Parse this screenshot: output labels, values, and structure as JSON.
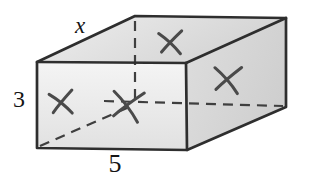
{
  "figure": {
    "width": 312,
    "height": 188,
    "background": "#ffffff",
    "labels": {
      "top_edge": "x",
      "left_edge": "3",
      "bottom_edge": "5"
    },
    "colors": {
      "edge": "#2e2e2e",
      "dash": "#3f3f3f",
      "xmark": "#4a4a4a",
      "front_face_from": "#f4f4f4",
      "front_face_to": "#e1e1e1",
      "top_face_from": "#eeeeee",
      "top_face_to": "#d3d3d3",
      "right_face_from": "#dedede",
      "right_face_to": "#cfcfcf"
    },
    "geometry": {
      "vertices": {
        "A": [
          37,
          62
        ],
        "B": [
          186,
          63
        ],
        "C": [
          187,
          150
        ],
        "D": [
          37,
          148
        ],
        "E": [
          135,
          16
        ],
        "F": [
          286,
          18
        ],
        "G": [
          286,
          107
        ],
        "H": [
          135,
          103
        ]
      },
      "faces": [
        {
          "id": "top-face",
          "points": [
            "A",
            "E",
            "F",
            "B"
          ],
          "gradient": "grad-top"
        },
        {
          "id": "right-face",
          "points": [
            "B",
            "F",
            "G",
            "C"
          ],
          "gradient": "grad-right"
        },
        {
          "id": "front-face",
          "points": [
            "A",
            "B",
            "C",
            "D"
          ],
          "gradient": "grad-front"
        }
      ],
      "outer_outline": [
        "D",
        "A",
        "E",
        "F",
        "G",
        "C"
      ],
      "inner_edges": [
        {
          "id": "front-top-edge",
          "from": "A",
          "to": "B"
        },
        {
          "id": "front-right-edge",
          "from": "B",
          "to": "C"
        },
        {
          "id": "top-right-edge",
          "from": "B",
          "to": "F"
        }
      ],
      "dashed_lines": [
        {
          "id": "hidden-vertical-edge",
          "x1": 135,
          "y1": 21,
          "x2": 135,
          "y2": 100
        },
        {
          "id": "hidden-horizontal-edge",
          "x1": 104,
          "y1": 101,
          "x2": 283,
          "y2": 106
        },
        {
          "id": "hidden-diagonal-edge",
          "x1": 40,
          "y1": 146,
          "x2": 129,
          "y2": 107
        }
      ],
      "dash_pattern": "10 7",
      "edge_width": 2.7,
      "dash_width": 2.2,
      "xmark_width": 3,
      "xmarks": [
        {
          "id": "xmark-top-face",
          "cx": 171,
          "cy": 42,
          "s": 13,
          "rot": -4
        },
        {
          "id": "xmark-right-face",
          "cx": 228,
          "cy": 79,
          "s": 15,
          "rot": 2
        },
        {
          "id": "xmark-front-face",
          "cx": 62,
          "cy": 102,
          "s": 13,
          "rot": -8
        },
        {
          "id": "xmark-hidden-corner",
          "cx": 128,
          "cy": 105,
          "s": 17,
          "rot": 6
        }
      ]
    }
  }
}
